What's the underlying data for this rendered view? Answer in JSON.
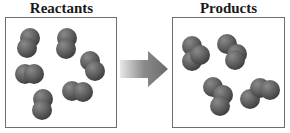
{
  "reactants": {
    "title": "Reactants",
    "molecules": [
      {
        "name": "molecule-1",
        "x": 20,
        "y": 28,
        "atoms": [
          [
            0,
            0
          ],
          [
            -3,
            10
          ]
        ]
      },
      {
        "name": "molecule-2",
        "x": 57,
        "y": 28,
        "atoms": [
          [
            0,
            0
          ],
          [
            -1,
            11
          ]
        ]
      },
      {
        "name": "molecule-3",
        "x": 80,
        "y": 51,
        "atoms": [
          [
            0,
            0
          ],
          [
            5,
            10
          ]
        ]
      },
      {
        "name": "molecule-4",
        "x": 15,
        "y": 64,
        "atoms": [
          [
            0,
            0
          ],
          [
            9,
            0
          ]
        ]
      },
      {
        "name": "molecule-5",
        "x": 62,
        "y": 81,
        "atoms": [
          [
            0,
            0
          ],
          [
            11,
            1
          ]
        ]
      },
      {
        "name": "molecule-6",
        "x": 33,
        "y": 89,
        "atoms": [
          [
            0,
            0
          ],
          [
            -1,
            11
          ]
        ]
      }
    ]
  },
  "products": {
    "title": "Products",
    "molecules": [
      {
        "name": "product-1",
        "x": 182,
        "y": 36,
        "atoms": [
          [
            0,
            0
          ],
          [
            0,
            15
          ],
          [
            8,
            9
          ]
        ]
      },
      {
        "name": "product-2",
        "x": 217,
        "y": 34,
        "atoms": [
          [
            0,
            0
          ],
          [
            10,
            10
          ],
          [
            8,
            16
          ]
        ]
      },
      {
        "name": "product-3",
        "x": 203,
        "y": 77,
        "atoms": [
          [
            0,
            0
          ],
          [
            10,
            8
          ],
          [
            7,
            19
          ]
        ]
      },
      {
        "name": "product-4",
        "x": 240,
        "y": 74,
        "atoms": [
          [
            0,
            15
          ],
          [
            10,
            4
          ],
          [
            20,
            6
          ]
        ]
      }
    ]
  },
  "arrow": {
    "direction": "right",
    "color": "#6e6e6e"
  }
}
